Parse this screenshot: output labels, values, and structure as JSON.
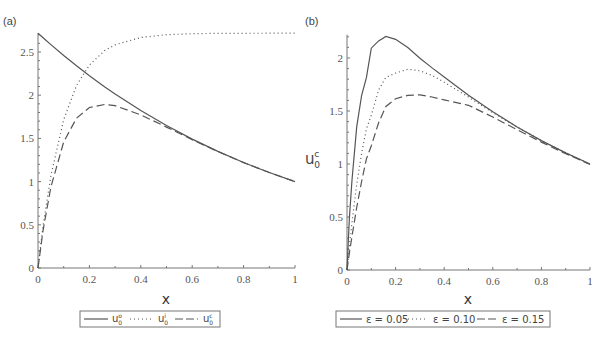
{
  "chart_data": [
    {
      "panel": "(a)",
      "type": "line",
      "title": "",
      "xlabel": "x",
      "ylabel": "",
      "xlim": [
        0,
        1
      ],
      "ylim": [
        0,
        2.72
      ],
      "xticks": [
        0,
        0.2,
        0.4,
        0.6,
        0.8,
        1
      ],
      "xtick_labels": [
        "0",
        "0.2",
        "0.4",
        "0.6",
        "0.8",
        "1"
      ],
      "yticks": [
        0,
        0.5,
        1,
        1.5,
        2,
        2.5
      ],
      "ytick_labels": [
        "0",
        "0.5",
        "1",
        "1.5",
        "2",
        "2.5"
      ],
      "grid": false,
      "legend_position": "bottom",
      "x": [
        0,
        0.02,
        0.05,
        0.1,
        0.15,
        0.2,
        0.26,
        0.3,
        0.4,
        0.5,
        0.6,
        0.7,
        0.8,
        0.9,
        1
      ],
      "series": [
        {
          "name": "u0^o",
          "label_base": "u",
          "sub": "0",
          "sup": "o",
          "style": "solid",
          "values": [
            2.718,
            2.664,
            2.586,
            2.46,
            2.34,
            2.226,
            2.096,
            2.014,
            1.822,
            1.649,
            1.492,
            1.35,
            1.221,
            1.105,
            1.0
          ]
        },
        {
          "name": "u0^i",
          "label_base": "u",
          "sub": "0",
          "sup": "i",
          "style": "dotted",
          "values": [
            0,
            0.493,
            1.07,
            1.718,
            2.112,
            2.35,
            2.517,
            2.583,
            2.668,
            2.7,
            2.712,
            2.716,
            2.717,
            2.718,
            2.718
          ]
        },
        {
          "name": "u0^c",
          "label_base": "u",
          "sub": "0",
          "sup": "c",
          "style": "dashed",
          "values": [
            0,
            0.439,
            0.937,
            1.46,
            1.734,
            1.858,
            1.894,
            1.879,
            1.772,
            1.631,
            1.485,
            1.348,
            1.22,
            1.105,
            1.0
          ]
        }
      ]
    },
    {
      "panel": "(b)",
      "type": "line",
      "title": "",
      "xlabel": "x",
      "ylabel": "u0^c",
      "ylabel_base": "u",
      "ylabel_sub": "0",
      "ylabel_sup": "c",
      "xlim": [
        0,
        1
      ],
      "ylim": [
        0,
        2.22
      ],
      "xticks": [
        0,
        0.2,
        0.4,
        0.6,
        0.8,
        1
      ],
      "xtick_labels": [
        "0",
        "0.2",
        "0.4",
        "0.6",
        "0.8",
        "1"
      ],
      "yticks": [
        0,
        0.5,
        1,
        1.5,
        2
      ],
      "ytick_labels": [
        "0",
        "0.5",
        "1",
        "1.5",
        "2"
      ],
      "grid": false,
      "legend_position": "bottom",
      "x": [
        0,
        0.01,
        0.02,
        0.04,
        0.06,
        0.08,
        0.1,
        0.13,
        0.16,
        0.2,
        0.25,
        0.3,
        0.35,
        0.4,
        0.5,
        0.6,
        0.7,
        0.8,
        0.9,
        1
      ],
      "series": [
        {
          "name": "ε = 0.05",
          "style": "solid",
          "values": [
            0,
            0.494,
            0.838,
            1.35,
            1.646,
            1.814,
            2.092,
            2.161,
            2.203,
            2.176,
            2.098,
            1.998,
            1.907,
            1.821,
            1.648,
            1.492,
            1.35,
            1.221,
            1.105,
            1.0
          ]
        },
        {
          "name": "ε = 0.10",
          "style": "dotted",
          "values": [
            0,
            0.232,
            0.441,
            0.81,
            1.1,
            1.331,
            1.46,
            1.697,
            1.818,
            1.858,
            1.894,
            1.879,
            1.836,
            1.772,
            1.631,
            1.485,
            1.348,
            1.22,
            1.105,
            1.0
          ]
        },
        {
          "name": "ε = 0.15",
          "style": "dashed",
          "values": [
            0,
            0.161,
            0.312,
            0.59,
            0.835,
            1.048,
            1.172,
            1.39,
            1.542,
            1.616,
            1.648,
            1.652,
            1.632,
            1.605,
            1.554,
            1.443,
            1.324,
            1.207,
            1.097,
            0.995
          ]
        }
      ]
    }
  ],
  "panels": {
    "a": {
      "label": "(a)",
      "xlabel": "x",
      "legend": [
        {
          "base": "u",
          "sub": "0",
          "sup": "o"
        },
        {
          "base": "u",
          "sub": "0",
          "sup": "i"
        },
        {
          "base": "u",
          "sub": "0",
          "sup": "c"
        }
      ]
    },
    "b": {
      "label": "(b)",
      "xlabel": "x",
      "ylabel": {
        "base": "u",
        "sub": "0",
        "sup": "c"
      },
      "legend": [
        "ε = 0.05",
        "ε = 0.10",
        "ε = 0.15"
      ]
    }
  },
  "colors": {
    "curve": "#555555",
    "axis": "#777777",
    "text": "#444444",
    "background": "#ffffff"
  }
}
